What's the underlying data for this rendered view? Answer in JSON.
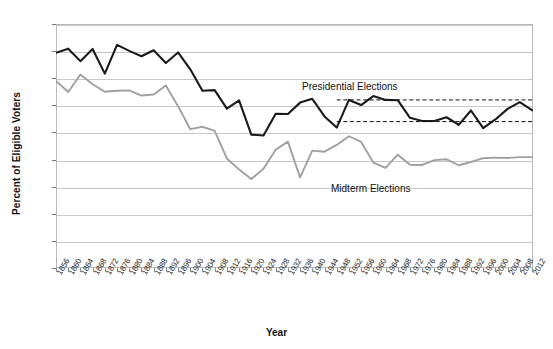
{
  "chart_data": {
    "type": "line",
    "title": "",
    "xlabel": "Year",
    "ylabel": "Percent of Eligible Voters",
    "ylim": [
      0,
      90
    ],
    "ytick_values": [
      0,
      10,
      20,
      30,
      40,
      50,
      60,
      70,
      80,
      90
    ],
    "grid": true,
    "legend_position": "inline-annotations",
    "x": [
      1856,
      1860,
      1864,
      1868,
      1872,
      1876,
      1880,
      1884,
      1888,
      1892,
      1896,
      1900,
      1904,
      1908,
      1912,
      1916,
      1920,
      1924,
      1928,
      1932,
      1936,
      1940,
      1944,
      1948,
      1952,
      1956,
      1960,
      1964,
      1968,
      1972,
      1976,
      1980,
      1984,
      1988,
      1992,
      1996,
      2000,
      2004,
      2008,
      2012
    ],
    "xtick_labels": [
      "1856",
      "1860",
      "1864",
      "1868",
      "1872",
      "1876",
      "1880",
      "1884",
      "1888",
      "1892",
      "1896",
      "1900",
      "1904",
      "1908",
      "1912",
      "1916",
      "1920",
      "1924",
      "1928",
      "1932",
      "1936",
      "1940",
      "1944",
      "1948",
      "1952",
      "1956",
      "1960",
      "1964",
      "1968",
      "1972",
      "1976",
      "1980",
      "1984",
      "1988",
      "1992",
      "1996",
      "2000",
      "2004",
      "2008",
      "2012"
    ],
    "series": [
      {
        "name": "Presidential Elections",
        "color": "#1a1a1a",
        "values": [
          79.4,
          80.9,
          76.3,
          80.8,
          71.7,
          82.3,
          80.1,
          78.1,
          80.3,
          75.6,
          79.5,
          73.3,
          65.4,
          65.6,
          58.8,
          61.8,
          49.2,
          48.9,
          56.9,
          56.8,
          61.0,
          62.4,
          55.9,
          51.8,
          62.0,
          60.1,
          63.4,
          62.0,
          61.9,
          55.4,
          54.2,
          54.2,
          55.6,
          52.8,
          58.1,
          51.6,
          54.8,
          58.7,
          61.2,
          58.2
        ]
      },
      {
        "name": "Midterm Elections",
        "color": "#a0a0a0",
        "values": [
          69.0,
          64.9,
          71.4,
          67.8,
          65.0,
          65.4,
          65.5,
          63.6,
          64.0,
          67.3,
          59.7,
          51.2,
          52.1,
          50.6,
          40.4,
          36.3,
          32.8,
          36.6,
          43.6,
          46.6,
          33.4,
          43.3,
          42.9,
          45.4,
          48.6,
          46.5,
          38.9,
          36.9,
          41.8,
          38.1,
          38.0,
          39.8,
          40.1,
          37.9,
          39.1,
          40.5,
          40.7,
          40.6,
          40.9,
          40.9
        ]
      }
    ],
    "reference_lines": [
      {
        "name": "presidential-upper-reference",
        "value": 62,
        "style": "dashed",
        "x_start": 1948,
        "x_end": 2012
      },
      {
        "name": "presidential-lower-reference",
        "value": 54,
        "style": "dashed",
        "x_start": 1948,
        "x_end": 2012
      }
    ],
    "annotations": [
      {
        "name": "presidential-elections-label",
        "text": "Presidential Elections"
      },
      {
        "name": "midterm-elections-label",
        "text": "Midterm Elections"
      }
    ]
  }
}
